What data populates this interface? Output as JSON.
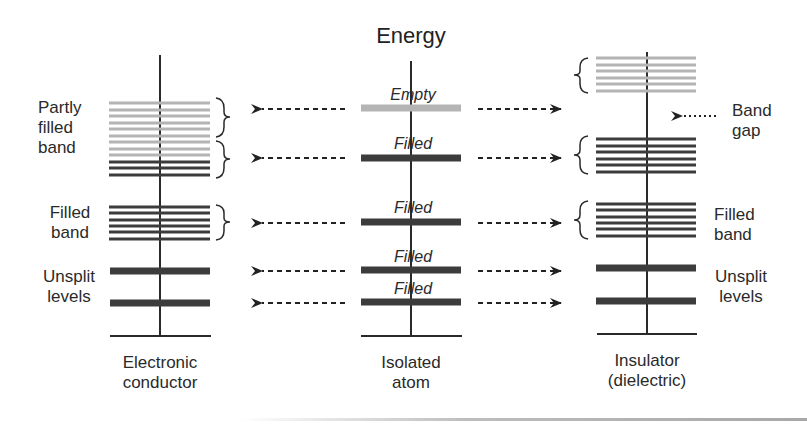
{
  "title": "Energy",
  "colors": {
    "filled": "#3c3c3c",
    "empty": "#b4b4b4",
    "axis": "#2a2a2a"
  },
  "columns": [
    {
      "id": "conductor",
      "label_line1": "Electronic",
      "label_line2": "conductor",
      "side_labels": {
        "partly_filled_band": [
          "Partly",
          "filled",
          "band"
        ],
        "filled_band": [
          "Filled",
          "band"
        ],
        "unsplit_levels": [
          "Unsplit",
          "levels"
        ]
      }
    },
    {
      "id": "isolated-atom",
      "label_line1": "Isolated",
      "label_line2": "atom",
      "levels": [
        {
          "state": "Empty"
        },
        {
          "state": "Filled"
        },
        {
          "state": "Filled"
        },
        {
          "state": "Filled"
        },
        {
          "state": "Filled"
        }
      ]
    },
    {
      "id": "insulator",
      "label_line1": "Insulator",
      "label_line2": "(dielectric)",
      "side_labels": {
        "band_gap": [
          "Band",
          "gap"
        ],
        "filled_band": [
          "Filled",
          "band"
        ],
        "unsplit_levels": [
          "Unsplit",
          "levels"
        ]
      }
    }
  ]
}
